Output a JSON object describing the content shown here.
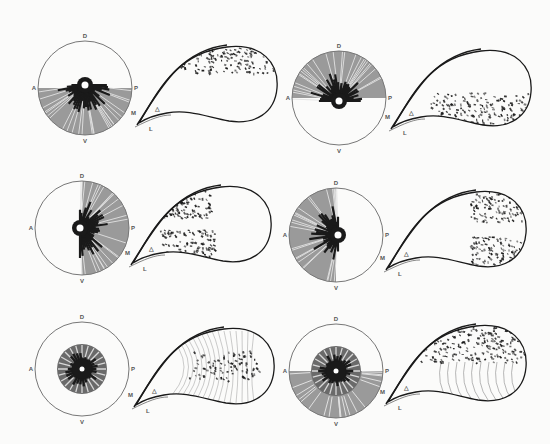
{
  "figure": {
    "panels": [
      {
        "id": "p1",
        "circle": {
          "cx": 85,
          "cy": 88,
          "r": 47,
          "shade": "ventral-half",
          "hub": "upper-edge",
          "labels": {
            "top": "D",
            "bottom": "V",
            "left": "A",
            "right": "P"
          }
        },
        "sac": {
          "x": 137,
          "y": 43,
          "density": "dorsal-top"
        },
        "sac_labels": {
          "m": "M",
          "l": "L",
          "delta": "△"
        }
      },
      {
        "id": "p2",
        "circle": {
          "cx": 339,
          "cy": 98,
          "r": 47,
          "shade": "dorsal-half",
          "hub": "lower-edge",
          "labels": {
            "top": "D",
            "bottom": "V",
            "left": "A",
            "right": "P"
          }
        },
        "sac": {
          "x": 391,
          "y": 47,
          "density": "ventral-bottom"
        },
        "sac_labels": {
          "m": "M",
          "l": "L",
          "delta": "△"
        }
      },
      {
        "id": "p3",
        "circle": {
          "cx": 82,
          "cy": 228,
          "r": 47,
          "shade": "posterior-half",
          "hub": "left-of-center",
          "labels": {
            "top": "D",
            "bottom": "V",
            "left": "A",
            "right": "P"
          }
        },
        "sac": {
          "x": 131,
          "y": 183,
          "density": "anterior-split"
        },
        "sac_labels": {
          "m": "M",
          "l": "L",
          "delta": "△"
        }
      },
      {
        "id": "p4",
        "circle": {
          "cx": 336,
          "cy": 235,
          "r": 47,
          "shade": "anterior-half",
          "hub": "right-of-center",
          "labels": {
            "top": "D",
            "bottom": "V",
            "left": "A",
            "right": "P"
          }
        },
        "sac": {
          "x": 386,
          "y": 188,
          "density": "posterior-split"
        },
        "sac_labels": {
          "m": "M",
          "l": "L",
          "delta": "△"
        }
      },
      {
        "id": "p5",
        "circle": {
          "cx": 82,
          "cy": 369,
          "r": 47,
          "shade": "central-disc",
          "hub": "center",
          "labels": {
            "top": "D",
            "bottom": "V",
            "left": "A",
            "right": "P"
          }
        },
        "sac": {
          "x": 134,
          "y": 325,
          "density": "central-arcs"
        },
        "sac_labels": {
          "m": "M",
          "l": "L",
          "delta": "△"
        }
      },
      {
        "id": "p6",
        "circle": {
          "cx": 336,
          "cy": 371,
          "r": 47,
          "shade": "central-disc-plus-ventral",
          "hub": "center",
          "labels": {
            "top": "D",
            "bottom": "V",
            "left": "A",
            "right": "P"
          }
        },
        "sac": {
          "x": 386,
          "y": 322,
          "density": "dorsal-with-arcs"
        },
        "sac_labels": {
          "m": "M",
          "l": "L",
          "delta": "△"
        }
      }
    ],
    "colors": {
      "ink": "#1a1a1a",
      "shade": "#9a9a9a",
      "outline": "#777777",
      "paper": "#fbfbfa"
    }
  }
}
